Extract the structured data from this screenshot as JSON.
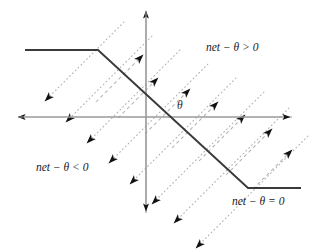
{
  "figure": {
    "kind": "diagram",
    "width": 323,
    "height": 249,
    "background_color": "#ffffff"
  },
  "colors": {
    "axis": "#9a9a9a",
    "activation_curve": "#3a3a3a",
    "gradient_line": "#b0b0b0",
    "arrowhead": "#111111",
    "label_text": "#1a1a1a"
  },
  "labels": {
    "region_positive": "net − θ > 0",
    "region_negative": "net − θ < 0",
    "boundary": "net − θ = 0",
    "threshold": "θ"
  },
  "axes": {
    "x_axis": {
      "name": "horizontal-axis",
      "y": 117,
      "x_start": 16,
      "x_end": 292,
      "arrow_left": true,
      "arrow_right": true
    },
    "y_axis": {
      "name": "vertical-axis",
      "x": 146,
      "y_start": 9,
      "y_end": 215,
      "arrow_up": true,
      "arrow_down": true
    }
  },
  "activation_curve": {
    "name": "ramp-activation-function",
    "points": [
      [
        25,
        50
      ],
      [
        98,
        50
      ],
      [
        248,
        188
      ],
      [
        301,
        188
      ]
    ],
    "stroke_width": 1.9
  },
  "gradient_field": {
    "up_right": {
      "style": "dashed",
      "direction": "up-right",
      "angle_deg": 45,
      "count": 6,
      "lines": [
        [
          118,
          118,
          156,
          80
        ],
        [
          144,
          134,
          189,
          89
        ],
        [
          172,
          146,
          217,
          101
        ],
        [
          199,
          159,
          244,
          114
        ],
        [
          226,
          172,
          271,
          127
        ],
        [
          253,
          186,
          290,
          149
        ]
      ],
      "extra_lines": [
        [
          96,
          102,
          143,
          55
        ],
        [
          124,
          118,
          148,
          94
        ]
      ]
    },
    "down_left": {
      "style": "dotted",
      "direction": "down-left",
      "angle_deg": 225,
      "count": 6,
      "lines": [
        [
          124,
          22,
          45,
          101
        ],
        [
          152,
          36,
          66,
          122
        ],
        [
          180,
          50,
          87,
          143
        ],
        [
          208,
          64,
          109,
          163
        ],
        [
          236,
          78,
          130,
          184
        ],
        [
          264,
          92,
          152,
          204
        ]
      ],
      "extra_lines": [
        [
          289,
          106,
          174,
          221
        ],
        [
          306,
          132,
          196,
          242
        ]
      ]
    }
  }
}
